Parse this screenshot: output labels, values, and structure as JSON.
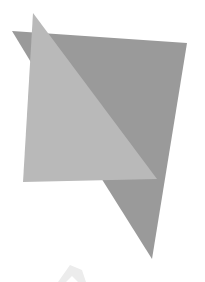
{
  "canvas": {
    "width": 205,
    "height": 282,
    "background": "#ffffff"
  },
  "shapes": {
    "dark_quad": {
      "points": "12,31 187,43 152,259 103,181",
      "fill": "#9a9a9a"
    },
    "light_triangle": {
      "points": "33,13 23,182 157,179",
      "fill": "#b9b9b9"
    },
    "overlap_edge": {
      "points": "33,13 103,181 157,179",
      "fill": "#b3b3b3"
    },
    "faint_arrow": {
      "points": "58,282 70,265 82,270 86,282 78,282 72,276 66,282",
      "fill": "#ececec"
    }
  }
}
